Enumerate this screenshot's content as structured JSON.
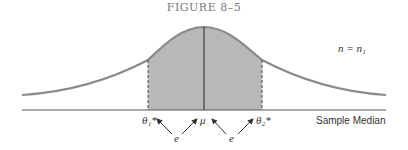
{
  "figure": {
    "title": "FIGURE 8–5",
    "curve_label": "n = n₁",
    "axis_label": "Sample Median",
    "mean_label": "μ",
    "theta1_label": "θ₁*",
    "theta2_label": "θ₂*",
    "error_label": "e",
    "colors": {
      "curve": "#8a8a8a",
      "fill": "#b8b8b8",
      "axis": "#555555"
    }
  }
}
